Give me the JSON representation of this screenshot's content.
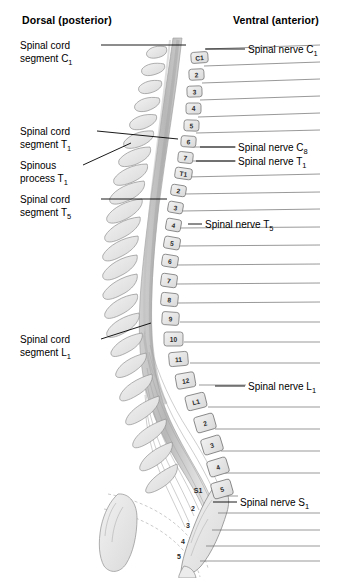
{
  "figure": {
    "background_color": "#ffffff",
    "ink_color": "#1a1a1a",
    "bone_fill": "#e8e8e8",
    "cord_fill": "#d0d0d0"
  },
  "headers": {
    "dorsal": "Dorsal (posterior)",
    "ventral": "Ventral (anterior)"
  },
  "left_labels": [
    {
      "id": "cord-c1",
      "line1": "Spinal cord",
      "line2": "segment C",
      "sub": "1",
      "x": 20,
      "y": 40,
      "leader": {
        "x1": 101,
        "y1": 45,
        "x2": 186,
        "y2": 45
      }
    },
    {
      "id": "cord-t1",
      "line1": "Spinal cord",
      "line2": "segment T",
      "sub": "1",
      "x": 20,
      "y": 126,
      "leader": {
        "x1": 97,
        "y1": 131,
        "x2": 178,
        "y2": 139
      }
    },
    {
      "id": "spinous-t1",
      "line1": "Spinous",
      "line2": "process T",
      "sub": "1",
      "x": 20,
      "y": 160,
      "leader": {
        "x1": 83,
        "y1": 165,
        "x2": 131,
        "y2": 143
      }
    },
    {
      "id": "cord-t5",
      "line1": "Spinal cord",
      "line2": "segment T",
      "sub": "5",
      "x": 20,
      "y": 194,
      "leader": {
        "x1": 101,
        "y1": 199,
        "x2": 167,
        "y2": 199
      }
    },
    {
      "id": "cord-l1",
      "line1": "Spinal cord",
      "line2": "segment L",
      "sub": "1",
      "x": 20,
      "y": 334,
      "leader": {
        "x1": 101,
        "y1": 339,
        "x2": 151,
        "y2": 323
      }
    }
  ],
  "right_labels": [
    {
      "id": "nerve-c1",
      "text": "Spinal nerve C",
      "sub": "1",
      "x": 248,
      "y": 44,
      "leader": {
        "x1": 205,
        "y1": 49,
        "x2": 245,
        "y2": 49
      }
    },
    {
      "id": "nerve-c8",
      "text": "Spinal nerve C",
      "sub": "8",
      "x": 238,
      "y": 142,
      "leader": {
        "x1": 200,
        "y1": 147,
        "x2": 235,
        "y2": 147
      }
    },
    {
      "id": "nerve-t1",
      "text": "Spinal nerve T",
      "sub": "1",
      "x": 238,
      "y": 156,
      "leader": {
        "x1": 196,
        "y1": 161,
        "x2": 235,
        "y2": 161
      }
    },
    {
      "id": "nerve-t5",
      "text": "Spinal nerve T",
      "sub": "5",
      "x": 205,
      "y": 219,
      "leader": {
        "x1": 188,
        "y1": 224,
        "x2": 202,
        "y2": 224
      }
    },
    {
      "id": "nerve-l1",
      "text": "Spinal nerve L",
      "sub": "1",
      "x": 248,
      "y": 381,
      "leader": {
        "x1": 215,
        "y1": 386,
        "x2": 245,
        "y2": 386
      }
    },
    {
      "id": "nerve-s1",
      "text": "Spinal nerve S",
      "sub": "1",
      "x": 240,
      "y": 497,
      "leader": {
        "x1": 213,
        "y1": 502,
        "x2": 237,
        "y2": 502
      }
    }
  ],
  "vertebrae": [
    {
      "label": "C1",
      "x": 191,
      "y": 52,
      "w": 17,
      "h": 11,
      "rot": -4
    },
    {
      "label": "2",
      "x": 189,
      "y": 69,
      "w": 15,
      "h": 11,
      "rot": -3
    },
    {
      "label": "3",
      "x": 187,
      "y": 86,
      "w": 15,
      "h": 11,
      "rot": -2
    },
    {
      "label": "4",
      "x": 186,
      "y": 103,
      "w": 15,
      "h": 11,
      "rot": 0
    },
    {
      "label": "5",
      "x": 184,
      "y": 120,
      "w": 15,
      "h": 11,
      "rot": 2
    },
    {
      "label": "6",
      "x": 181,
      "y": 136,
      "w": 15,
      "h": 11,
      "rot": 4
    },
    {
      "label": "7",
      "x": 178,
      "y": 152,
      "w": 15,
      "h": 11,
      "rot": 6
    },
    {
      "label": "T1",
      "x": 175,
      "y": 168,
      "w": 17,
      "h": 11,
      "rot": 8
    },
    {
      "label": "2",
      "x": 171,
      "y": 185,
      "w": 15,
      "h": 11,
      "rot": 9
    },
    {
      "label": "3",
      "x": 168,
      "y": 202,
      "w": 15,
      "h": 11,
      "rot": 10
    },
    {
      "label": "4",
      "x": 166,
      "y": 219,
      "w": 15,
      "h": 12,
      "rot": 10
    },
    {
      "label": "5",
      "x": 164,
      "y": 237,
      "w": 16,
      "h": 12,
      "rot": 10
    },
    {
      "label": "6",
      "x": 162,
      "y": 255,
      "w": 16,
      "h": 12,
      "rot": 9
    },
    {
      "label": "7",
      "x": 161,
      "y": 274,
      "w": 16,
      "h": 13,
      "rot": 8
    },
    {
      "label": "8",
      "x": 161,
      "y": 293,
      "w": 17,
      "h": 13,
      "rot": 6
    },
    {
      "label": "9",
      "x": 162,
      "y": 312,
      "w": 17,
      "h": 13,
      "rot": 4
    },
    {
      "label": "10",
      "x": 164,
      "y": 332,
      "w": 19,
      "h": 14,
      "rot": 0
    },
    {
      "label": "11",
      "x": 169,
      "y": 352,
      "w": 19,
      "h": 14,
      "rot": -5
    },
    {
      "label": "12",
      "x": 176,
      "y": 373,
      "w": 19,
      "h": 15,
      "rot": -10
    },
    {
      "label": "L1",
      "x": 186,
      "y": 394,
      "w": 20,
      "h": 15,
      "rot": -14
    },
    {
      "label": "2",
      "x": 195,
      "y": 415,
      "w": 20,
      "h": 16,
      "rot": -16
    },
    {
      "label": "3",
      "x": 202,
      "y": 437,
      "w": 20,
      "h": 16,
      "rot": -17
    },
    {
      "label": "4",
      "x": 208,
      "y": 459,
      "w": 20,
      "h": 16,
      "rot": -17
    },
    {
      "label": "5",
      "x": 212,
      "y": 481,
      "w": 20,
      "h": 16,
      "rot": -16
    }
  ],
  "sacral_labels": [
    {
      "label": "S1",
      "x": 198,
      "y": 493
    },
    {
      "label": "2",
      "x": 193,
      "y": 511
    },
    {
      "label": "3",
      "x": 188,
      "y": 528
    },
    {
      "label": "4",
      "x": 183,
      "y": 544
    },
    {
      "label": "5",
      "x": 179,
      "y": 559
    }
  ],
  "nerve_lines_right": [
    {
      "x1": 206,
      "y1": 49,
      "x2": 320,
      "y2": 45
    },
    {
      "x1": 204,
      "y1": 66,
      "x2": 320,
      "y2": 62
    },
    {
      "x1": 202,
      "y1": 83,
      "x2": 320,
      "y2": 79
    },
    {
      "x1": 200,
      "y1": 100,
      "x2": 320,
      "y2": 96
    },
    {
      "x1": 198,
      "y1": 117,
      "x2": 320,
      "y2": 113
    },
    {
      "x1": 196,
      "y1": 133,
      "x2": 320,
      "y2": 130
    },
    {
      "x1": 193,
      "y1": 147,
      "x2": 236,
      "y2": 147
    },
    {
      "x1": 190,
      "y1": 161,
      "x2": 236,
      "y2": 161
    },
    {
      "x1": 187,
      "y1": 177,
      "x2": 320,
      "y2": 174
    },
    {
      "x1": 184,
      "y1": 194,
      "x2": 320,
      "y2": 192
    },
    {
      "x1": 182,
      "y1": 211,
      "x2": 320,
      "y2": 209
    },
    {
      "x1": 180,
      "y1": 228,
      "x2": 320,
      "y2": 227
    },
    {
      "x1": 178,
      "y1": 246,
      "x2": 320,
      "y2": 245
    },
    {
      "x1": 177,
      "y1": 265,
      "x2": 320,
      "y2": 264
    },
    {
      "x1": 177,
      "y1": 284,
      "x2": 320,
      "y2": 283
    },
    {
      "x1": 178,
      "y1": 303,
      "x2": 320,
      "y2": 302
    },
    {
      "x1": 180,
      "y1": 322,
      "x2": 320,
      "y2": 322
    },
    {
      "x1": 184,
      "y1": 342,
      "x2": 320,
      "y2": 342
    },
    {
      "x1": 190,
      "y1": 363,
      "x2": 320,
      "y2": 363
    },
    {
      "x1": 199,
      "y1": 385,
      "x2": 246,
      "y2": 385
    },
    {
      "x1": 208,
      "y1": 407,
      "x2": 320,
      "y2": 407
    },
    {
      "x1": 215,
      "y1": 429,
      "x2": 320,
      "y2": 429
    },
    {
      "x1": 221,
      "y1": 451,
      "x2": 320,
      "y2": 451
    },
    {
      "x1": 225,
      "y1": 473,
      "x2": 320,
      "y2": 473
    },
    {
      "x1": 222,
      "y1": 496,
      "x2": 238,
      "y2": 496
    },
    {
      "x1": 218,
      "y1": 513,
      "x2": 320,
      "y2": 513
    },
    {
      "x1": 212,
      "y1": 530,
      "x2": 320,
      "y2": 530
    },
    {
      "x1": 206,
      "y1": 546,
      "x2": 320,
      "y2": 546
    },
    {
      "x1": 200,
      "y1": 561,
      "x2": 320,
      "y2": 561
    }
  ]
}
